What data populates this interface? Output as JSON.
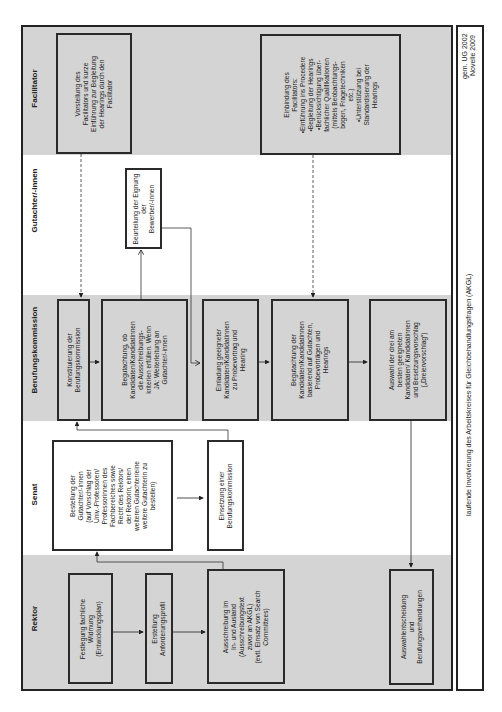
{
  "title": "laufende Involvierung des Arbeitskreises für Gleichbehandlungsfragen (AKGL)",
  "legal_basis": {
    "line1": "gem. UG 2002",
    "line2": "Novelle 2009"
  },
  "lanes": {
    "facilitator": "Facilitator",
    "gutachter": "Gutachter/-innen",
    "kommission": "Berufungskommission",
    "senat": "Senat",
    "rektor": "Rektor"
  },
  "boxes": {
    "vorstellung": "Vorstellung des\nFacilitators und kurze\nEinführung zur Begleitung\nder Hearings durch den\nFacilitator",
    "einbindung": "Einbindung des\nFacilitators:\n•Einführung ins Procedere\n•Begleitung der Hearings\n•Berücksichtigung über-\nfachlicher Qualifikationen\n(mittels Beobachtungs-\nbogen, Fragetechniken\netc.)\n•Unterstützung bei\nStandardisierung der\nHearings",
    "beurteilung": "Beurteilung der Eignung\nder\nBewerber/-innen",
    "konstituierung": "Konstituierung der\nBerufungskommission",
    "begutachtung_ob": "Begutachtung, ob\nKandidaten/Kandidatinnen\ndie Ausschreibungs-\nkriterien erfüllen. Wenn\nJA: Weiterleitung an\nGutachter/-innen",
    "einladung": "Einladung geeigneter\nKandidaten/Kandidatinnen\nzu Probevortrag und\nHearing",
    "begutachtung_der": "Begutachtung der\nKandidaten/Kandidatinnen\nbasierend auf Gutachten,\nProbevorträgen und\nHearings",
    "auswahl": "Auswahl der drei am\nbesten geeigneten\nKandidaten/ Kandidatinnen\nund Besetzungsvorschlag\n(„Dreiervorschlag“)",
    "bestellung": "Bestellung der\nGutachter/-innen\n(auf Vorschlag der\nUniv.-Professoren/\nProfessorinnen des\nFachbereiches sowie\nRecht des Rektors/\nder Rektorin, einen\nweiteren Gutachter/eine\nweitere Gutachterin zu\nbestellen)",
    "einsetzung": "Einsetzung einer\nBerufungskommission",
    "festlegung": "Festlegung fachliche\nWidmung\n(Entwicklungsplan)",
    "erstellung": "Erstellung\nAnforderungsprofil",
    "ausschreibung": "Ausschreibung im\nIn- und Ausland\n(Ausschreibungstext\nzuvor an AKGL)\n(evtl. Einsatz von Search\nCommittees)",
    "auswahlentscheidung": "Auswahlentscheidung\nund\nBerufungsverhandlungen"
  },
  "colors": {
    "lane_gray": "#d4d4d4",
    "border": "#222222",
    "background": "#ffffff"
  }
}
